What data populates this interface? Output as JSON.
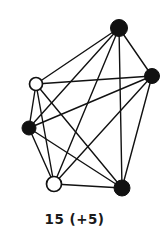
{
  "figure": {
    "caption": "15 (+5)",
    "background_color": "#ffffff",
    "ink_color": "#111111",
    "width": 163,
    "height": 249
  },
  "chart_data": {
    "type": "diagram",
    "diagram_kind": "node-link-graph",
    "title": "15 (+5)",
    "edge_count": 15,
    "vertex_count": 6,
    "filled_vertex_count": 4,
    "hollow_vertex_count": 2,
    "nodes": [
      {
        "id": "top",
        "label": "",
        "x": 119,
        "y": 28,
        "style": "filled",
        "radius": 8.5
      },
      {
        "id": "right",
        "label": "",
        "x": 152,
        "y": 76,
        "style": "filled",
        "radius": 7.5
      },
      {
        "id": "upper_left",
        "label": "",
        "x": 36,
        "y": 84,
        "style": "hollow",
        "radius": 6.5
      },
      {
        "id": "left",
        "label": "",
        "x": 29,
        "y": 128,
        "style": "filled",
        "radius": 7.0
      },
      {
        "id": "lower_left",
        "label": "",
        "x": 54,
        "y": 184,
        "style": "hollow",
        "radius": 7.5
      },
      {
        "id": "bottom_right",
        "label": "",
        "x": 122,
        "y": 188,
        "style": "filled",
        "radius": 8.0
      }
    ],
    "edges": [
      {
        "from": "top",
        "to": "right"
      },
      {
        "from": "top",
        "to": "upper_left"
      },
      {
        "from": "top",
        "to": "left"
      },
      {
        "from": "top",
        "to": "lower_left"
      },
      {
        "from": "top",
        "to": "bottom_right"
      },
      {
        "from": "right",
        "to": "upper_left"
      },
      {
        "from": "right",
        "to": "left"
      },
      {
        "from": "right",
        "to": "lower_left"
      },
      {
        "from": "right",
        "to": "bottom_right"
      },
      {
        "from": "upper_left",
        "to": "left"
      },
      {
        "from": "upper_left",
        "to": "lower_left"
      },
      {
        "from": "upper_left",
        "to": "bottom_right"
      },
      {
        "from": "left",
        "to": "lower_left"
      },
      {
        "from": "left",
        "to": "bottom_right"
      },
      {
        "from": "lower_left",
        "to": "bottom_right"
      }
    ],
    "legend": [],
    "xlabel": "",
    "ylabel": "",
    "grid": false
  }
}
